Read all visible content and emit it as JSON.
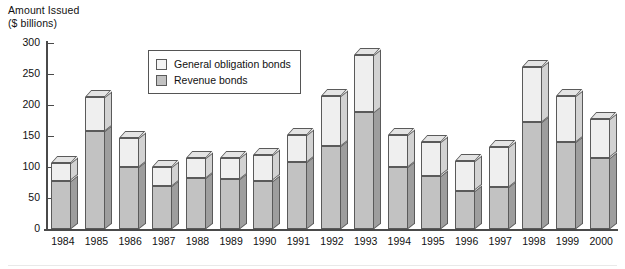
{
  "chart_data": {
    "type": "bar",
    "subtype": "stacked-column-3d",
    "title": "",
    "ylabel": "Amount Issued\n($ billions)",
    "ylabel_line1": "Amount Issued",
    "ylabel_line2": "($ billions)",
    "xlabel": "",
    "ylim": [
      0,
      300
    ],
    "yticks": [
      0,
      50,
      100,
      150,
      200,
      250,
      300
    ],
    "ytick_labels": [
      "0",
      "50",
      "100",
      "150",
      "200",
      "250",
      "300"
    ],
    "grid": false,
    "legend_position": "upper-left-inside",
    "categories": [
      "1984",
      "1985",
      "1986",
      "1987",
      "1988",
      "1989",
      "1990",
      "1991",
      "1992",
      "1993",
      "1994",
      "1995",
      "1996",
      "1997",
      "1998",
      "1999",
      "2000"
    ],
    "series": [
      {
        "name": "Revenue bonds",
        "color": "#c2c2c2",
        "values": [
          78,
          158,
          100,
          70,
          82,
          80,
          78,
          108,
          134,
          188,
          100,
          86,
          62,
          68,
          172,
          141,
          115
        ]
      },
      {
        "name": "General obligation bonds",
        "color": "#efefef",
        "values": [
          28,
          55,
          46,
          30,
          32,
          34,
          41,
          44,
          80,
          93,
          52,
          54,
          47,
          65,
          89,
          74,
          62
        ]
      }
    ],
    "totals": [
      106,
      213,
      146,
      100,
      114,
      114,
      119,
      152,
      214,
      281,
      152,
      140,
      109,
      133,
      261,
      215,
      177
    ]
  },
  "legend": {
    "items": [
      {
        "label": "General obligation bonds",
        "swatch": "light-swatch"
      },
      {
        "label": "Revenue bonds",
        "swatch": "gray-swatch"
      }
    ]
  }
}
